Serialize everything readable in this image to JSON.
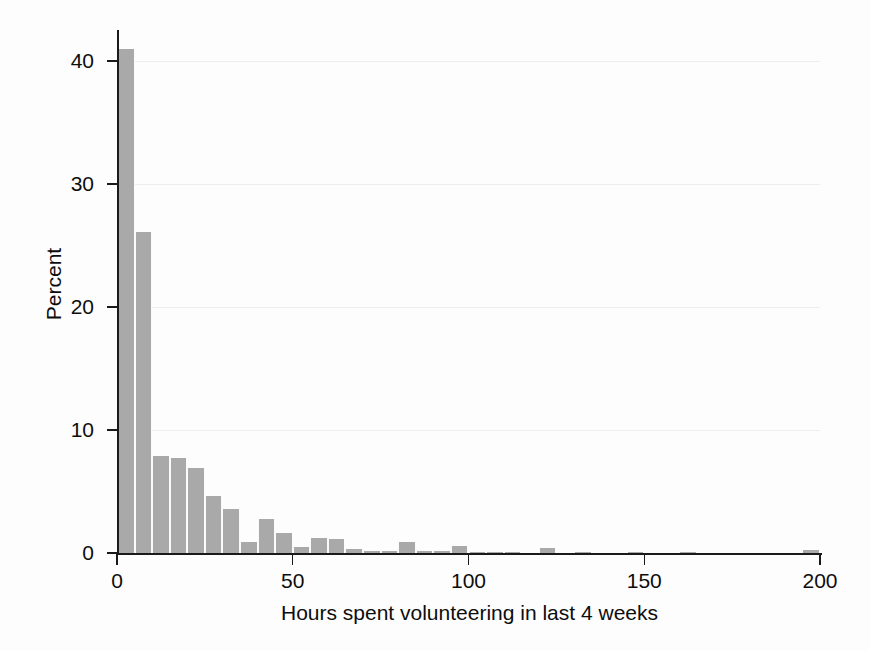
{
  "chart_data": {
    "type": "bar",
    "title": "",
    "subtitle": "",
    "xlabel": "Hours spent volunteering in last 4 weeks",
    "ylabel": "Percent",
    "xlim": [
      0,
      205
    ],
    "ylim": [
      0,
      43
    ],
    "xticks": [
      0,
      50,
      100,
      150,
      200
    ],
    "yticks": [
      0,
      10,
      20,
      30,
      40
    ],
    "xtick_labels": [
      "0",
      "50",
      "100",
      "150",
      "200"
    ],
    "ytick_labels": [
      "0",
      "10",
      "20",
      "30",
      "40"
    ],
    "grid": "horizontal",
    "legend": "none",
    "bin_width": 5,
    "bar_color": "#a9a9a9",
    "axis_color": "#1a1a1a",
    "grid_color": "#eeeeee",
    "background_color": "#fdfdfd",
    "bins": [
      {
        "x0": 0,
        "x1": 5,
        "value": 41.0
      },
      {
        "x0": 5,
        "x1": 10,
        "value": 26.1
      },
      {
        "x0": 10,
        "x1": 15,
        "value": 7.9
      },
      {
        "x0": 15,
        "x1": 20,
        "value": 7.7
      },
      {
        "x0": 20,
        "x1": 25,
        "value": 6.9
      },
      {
        "x0": 25,
        "x1": 30,
        "value": 4.6
      },
      {
        "x0": 30,
        "x1": 35,
        "value": 3.6
      },
      {
        "x0": 35,
        "x1": 40,
        "value": 0.9
      },
      {
        "x0": 40,
        "x1": 45,
        "value": 2.8
      },
      {
        "x0": 45,
        "x1": 50,
        "value": 1.6
      },
      {
        "x0": 50,
        "x1": 55,
        "value": 0.5
      },
      {
        "x0": 55,
        "x1": 60,
        "value": 1.2
      },
      {
        "x0": 60,
        "x1": 65,
        "value": 1.1
      },
      {
        "x0": 65,
        "x1": 70,
        "value": 0.35
      },
      {
        "x0": 70,
        "x1": 75,
        "value": 0.2
      },
      {
        "x0": 75,
        "x1": 80,
        "value": 0.15
      },
      {
        "x0": 80,
        "x1": 85,
        "value": 0.9
      },
      {
        "x0": 85,
        "x1": 90,
        "value": 0.15
      },
      {
        "x0": 90,
        "x1": 95,
        "value": 0.15
      },
      {
        "x0": 95,
        "x1": 100,
        "value": 0.55
      },
      {
        "x0": 100,
        "x1": 105,
        "value": 0.1
      },
      {
        "x0": 105,
        "x1": 110,
        "value": 0.1
      },
      {
        "x0": 110,
        "x1": 115,
        "value": 0.1
      },
      {
        "x0": 120,
        "x1": 125,
        "value": 0.4
      },
      {
        "x0": 130,
        "x1": 135,
        "value": 0.1
      },
      {
        "x0": 145,
        "x1": 150,
        "value": 0.1
      },
      {
        "x0": 160,
        "x1": 165,
        "value": 0.1
      },
      {
        "x0": 195,
        "x1": 200,
        "value": 0.28
      }
    ]
  }
}
